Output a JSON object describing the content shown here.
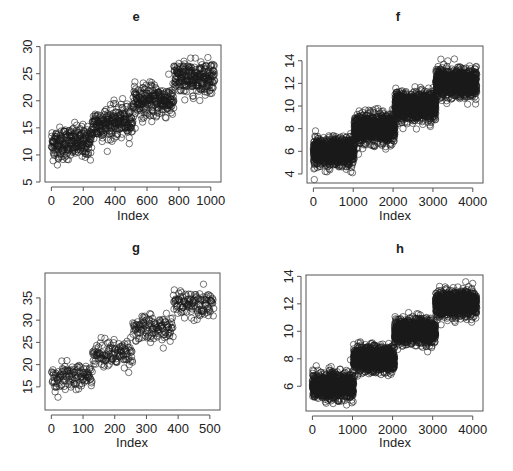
{
  "figure": {
    "width": 513,
    "height": 471,
    "point_color": "#1a1a1a",
    "frame_color": "#555555"
  },
  "chart_data": [
    {
      "type": "scatter",
      "title": "e",
      "xlabel": "Index",
      "ylabel": "",
      "n": 1024,
      "xlim": [
        -40,
        1064
      ],
      "ylim": [
        5,
        30.3
      ],
      "xticks": [
        0,
        200,
        400,
        600,
        800,
        1000
      ],
      "yticks": [
        5,
        10,
        15,
        20,
        25,
        30
      ],
      "segments": [
        {
          "from": 1,
          "to": 256,
          "start": 12,
          "end": 12.5,
          "sd": 2.0
        },
        {
          "from": 257,
          "to": 512,
          "start": 15.5,
          "end": 16.5,
          "sd": 2.0
        },
        {
          "from": 513,
          "to": 768,
          "start": 20,
          "end": 20,
          "sd": 2.0
        },
        {
          "from": 769,
          "to": 1024,
          "start": 24,
          "end": 24.5,
          "sd": 2.0
        }
      ],
      "frame": {
        "left": 45,
        "top": 45,
        "right": 221,
        "bottom": 182
      }
    },
    {
      "type": "scatter",
      "title": "f",
      "xlabel": "Index",
      "ylabel": "",
      "n": 4096,
      "xlim": [
        -160,
        4256
      ],
      "ylim": [
        3.2,
        15.3
      ],
      "xticks": [
        0,
        1000,
        2000,
        3000,
        4000
      ],
      "yticks": [
        4,
        6,
        8,
        10,
        12,
        14
      ],
      "segments": [
        {
          "from": 1,
          "to": 1024,
          "start": 5.9,
          "end": 6.0,
          "sd": 0.8
        },
        {
          "from": 1025,
          "to": 2048,
          "start": 8.0,
          "end": 8.0,
          "sd": 0.8
        },
        {
          "from": 2049,
          "to": 3072,
          "start": 10.0,
          "end": 10.0,
          "sd": 0.8
        },
        {
          "from": 3073,
          "to": 4096,
          "start": 12.0,
          "end": 12.0,
          "sd": 0.8
        }
      ],
      "frame": {
        "left": 307,
        "top": 46,
        "right": 483,
        "bottom": 183
      }
    },
    {
      "type": "scatter",
      "title": "g",
      "xlabel": "Index",
      "ylabel": "",
      "n": 512,
      "xlim": [
        -20,
        532
      ],
      "ylim": [
        9.8,
        40.6
      ],
      "xticks": [
        0,
        100,
        200,
        300,
        400,
        500
      ],
      "yticks": [
        15,
        20,
        25,
        30,
        35
      ],
      "segments": [
        {
          "from": 1,
          "to": 128,
          "start": 17,
          "end": 17.5,
          "sd": 2.0
        },
        {
          "from": 129,
          "to": 256,
          "start": 22,
          "end": 23,
          "sd": 2.0
        },
        {
          "from": 257,
          "to": 384,
          "start": 28,
          "end": 28,
          "sd": 2.0
        },
        {
          "from": 385,
          "to": 512,
          "start": 34,
          "end": 34,
          "sd": 2.0
        }
      ],
      "frame": {
        "left": 45,
        "top": 273,
        "right": 220,
        "bottom": 410
      }
    },
    {
      "type": "scatter",
      "title": "h",
      "xlabel": "Index",
      "ylabel": "",
      "n": 4096,
      "xlim": [
        -160,
        4256
      ],
      "ylim": [
        4.2,
        14.1
      ],
      "xticks": [
        0,
        1000,
        2000,
        3000,
        4000
      ],
      "yticks": [
        6,
        8,
        10,
        12,
        14
      ],
      "segments": [
        {
          "from": 1,
          "to": 1024,
          "start": 6.0,
          "end": 6.0,
          "sd": 0.6
        },
        {
          "from": 1025,
          "to": 2048,
          "start": 8.0,
          "end": 8.0,
          "sd": 0.6
        },
        {
          "from": 2049,
          "to": 3072,
          "start": 10.0,
          "end": 10.0,
          "sd": 0.6
        },
        {
          "from": 3073,
          "to": 4096,
          "start": 12.0,
          "end": 12.0,
          "sd": 0.6
        }
      ],
      "frame": {
        "left": 306,
        "top": 275,
        "right": 483,
        "bottom": 411
      }
    }
  ]
}
